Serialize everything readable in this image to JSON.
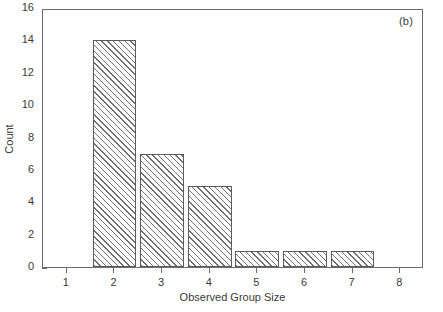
{
  "chart_data": {
    "type": "bar",
    "title": "",
    "panel_label": "(b)",
    "xlabel": "Observed Group Size",
    "ylabel": "Count",
    "categories": [
      1,
      2,
      3,
      4,
      5,
      6,
      7,
      8
    ],
    "values": [
      0,
      14,
      7,
      5,
      1,
      1,
      1,
      0
    ],
    "bars": [
      {
        "category": "2",
        "value": 14
      },
      {
        "category": "3",
        "value": 7
      },
      {
        "category": "4",
        "value": 5
      },
      {
        "category": "5",
        "value": 1
      },
      {
        "category": "6",
        "value": 1
      },
      {
        "category": "7",
        "value": 1
      }
    ],
    "xlim": [
      0.5,
      8.5
    ],
    "ylim": [
      0,
      16
    ],
    "xticks": [
      "1",
      "2",
      "3",
      "4",
      "5",
      "6",
      "7",
      "8"
    ],
    "yticks": [
      "0",
      "2",
      "4",
      "6",
      "8",
      "10",
      "12",
      "14",
      "16"
    ],
    "grid": false,
    "legend": null,
    "bar_style": {
      "fill": "diagonal-hatch",
      "edge_color": "#5c5c5c",
      "hatch_color": "#6f6f6f",
      "background": "#ffffff"
    },
    "axis_color": "#6b6b6b",
    "text_color": "#3a3a3a"
  }
}
